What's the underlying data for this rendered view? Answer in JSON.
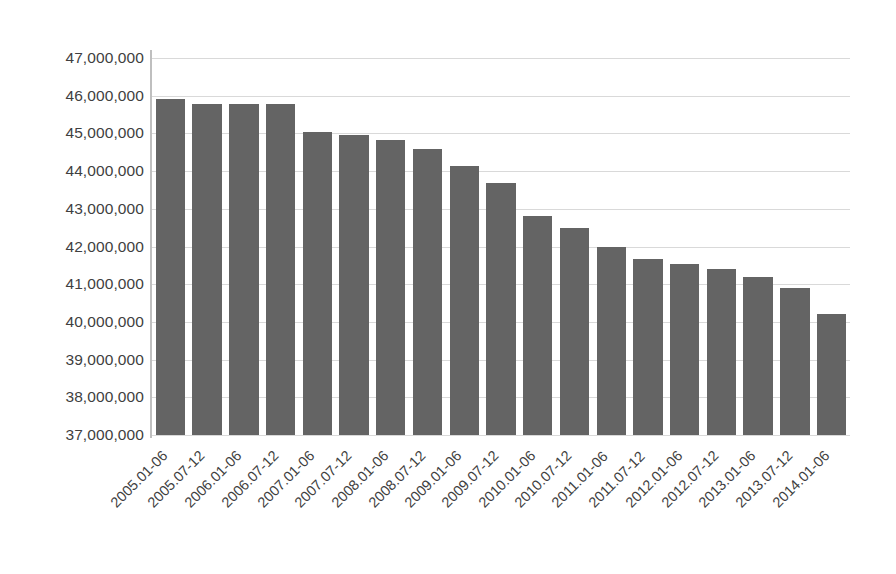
{
  "chart_data": {
    "type": "bar",
    "title": "",
    "subtitle": "",
    "xlabel": "",
    "ylabel": "",
    "legend": [],
    "legend_position": "none",
    "grid": true,
    "bar_color": "#646464",
    "gridline_color": "#d9d9d9",
    "axis_color": "#bfbfbf",
    "ylim": [
      37000000,
      47000000
    ],
    "ytick_step": 1000000,
    "ytick_labels": [
      "47,000,000",
      "46,000,000",
      "45,000,000",
      "44,000,000",
      "43,000,000",
      "42,000,000",
      "41,000,000",
      "40,000,000",
      "39,000,000",
      "38,000,000",
      "37,000,000"
    ],
    "ytick_values": [
      47000000,
      46000000,
      45000000,
      44000000,
      43000000,
      42000000,
      41000000,
      40000000,
      39000000,
      38000000,
      37000000
    ],
    "categories": [
      "2005.01-06",
      "2005.07-12",
      "2006.01-06",
      "2006.07-12",
      "2007.01-06",
      "2007.07-12",
      "2008.01-06",
      "2008.07-12",
      "2009.01-06",
      "2009.07-12",
      "2010.01-06",
      "2010.07-12",
      "2011.01-06",
      "2011.07-12",
      "2012.01-06",
      "2012.07-12",
      "2013.01-06",
      "2013.07-12",
      "2014.01-06"
    ],
    "values": [
      45900000,
      45780000,
      45780000,
      45780000,
      45050000,
      44950000,
      44820000,
      44580000,
      44130000,
      43680000,
      42800000,
      42500000,
      41980000,
      41680000,
      41530000,
      41400000,
      41180000,
      40900000,
      40200000
    ]
  }
}
